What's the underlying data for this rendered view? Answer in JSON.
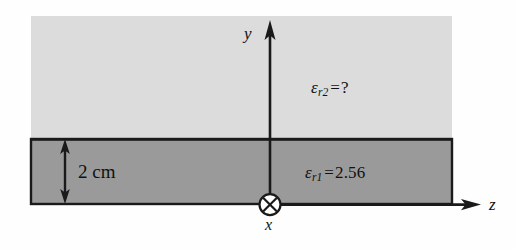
{
  "figure": {
    "background_color": "#fefefe"
  },
  "regions": {
    "upper": {
      "name": "region-2-upper-medium",
      "fill_color": "#dcdcdc",
      "label": {
        "symbol": "ε",
        "subscript": "r2",
        "equals": "=",
        "value": "?"
      }
    },
    "lower": {
      "name": "region-1-dielectric-slab",
      "fill_color": "#9a9a9a",
      "border_color": "#1a1a1a",
      "label": {
        "symbol": "ε",
        "subscript": "r1",
        "equals": "=",
        "value": "2.56"
      }
    }
  },
  "dimension": {
    "label": "2 cm",
    "arrow": "double-headed-vertical"
  },
  "axes": {
    "y": {
      "label": "y",
      "direction": "up"
    },
    "z": {
      "label": "z",
      "direction": "right"
    },
    "x": {
      "label": "x",
      "direction": "into-page",
      "marker": "circled-cross"
    }
  },
  "colors": {
    "stroke": "#1a1a1a",
    "upper_fill": "#dcdcdc",
    "lower_fill": "#9a9a9a",
    "text": "#111111"
  }
}
